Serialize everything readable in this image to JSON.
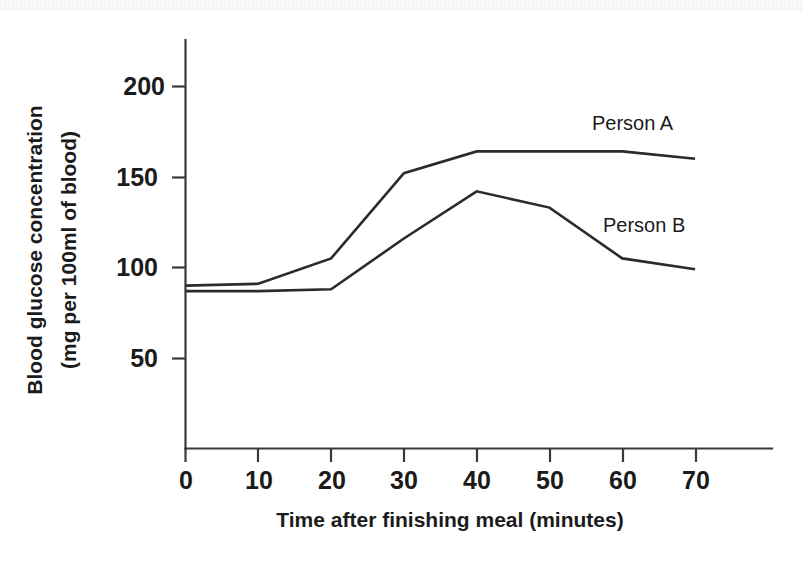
{
  "figure": {
    "background_color": "#ffffff",
    "ink_color": "#2b2b2b"
  },
  "chart_data": {
    "type": "line",
    "title": "",
    "subtitle": "",
    "xlabel": "Time after finishing meal (minutes)",
    "ylabel": "Blood glucose concentration (mg per 100ml of blood)",
    "ylabel_line1": "Blood glucose concentration",
    "ylabel_line2": "(mg per 100ml of blood)",
    "x": [
      0,
      10,
      20,
      30,
      40,
      50,
      60,
      70
    ],
    "xtick_labels": [
      "0",
      "10",
      "20",
      "30",
      "40",
      "50",
      "60",
      "70"
    ],
    "ytick_values": [
      50,
      100,
      150,
      200
    ],
    "ytick_labels": [
      "50",
      "100",
      "150",
      "200"
    ],
    "xlim": [
      0,
      80
    ],
    "ylim": [
      0,
      215
    ],
    "grid": false,
    "legend_position": "inline-annotations",
    "series": [
      {
        "name": "Person A",
        "label": "Person A",
        "values": [
          90,
          91,
          105,
          152,
          164,
          164,
          164,
          160
        ],
        "annotation": "Person A"
      },
      {
        "name": "Person B",
        "label": "Person B",
        "values": [
          87,
          87,
          88,
          116,
          142,
          133,
          105,
          99
        ],
        "annotation": "Person B"
      }
    ],
    "annotations": [
      {
        "text": "Person A",
        "x": 56,
        "y": 180
      },
      {
        "text": "Person B",
        "x": 57,
        "y": 124
      }
    ]
  }
}
